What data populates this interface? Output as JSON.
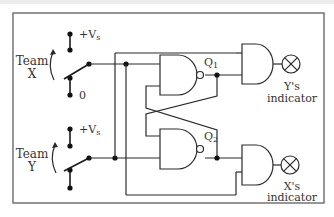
{
  "diagram": {
    "switches": [
      {
        "team_label_line1": "Team",
        "team_label_line2": "X",
        "top_contact": "+V",
        "top_contact_sub": "s",
        "bottom_contact": "0"
      },
      {
        "team_label_line1": "Team",
        "team_label_line2": "Y",
        "top_contact": "+V",
        "top_contact_sub": "s",
        "bottom_contact": ""
      }
    ],
    "nand_gates": [
      {
        "output_label": "Q",
        "output_sub": "1"
      },
      {
        "output_label": "Q",
        "output_sub": "2"
      }
    ],
    "indicators": [
      {
        "line1": "Y's",
        "line2": "indicator"
      },
      {
        "line1": "X's",
        "line2": "indicator"
      }
    ],
    "colors": {
      "wire": "#2a2a2a",
      "frame": "#6a6a6a",
      "text": "#333333"
    }
  }
}
